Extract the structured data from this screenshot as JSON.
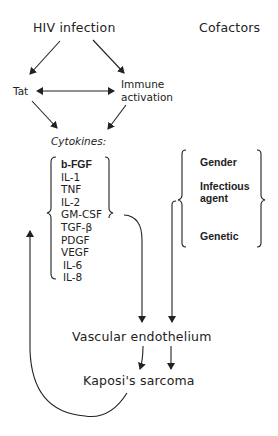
{
  "diagram": {
    "title_left": "HIV infection",
    "title_right": "Cofactors",
    "tat": "Tat",
    "immune": [
      "Immune",
      "activation"
    ],
    "cytokines_heading": "Cytokines:",
    "cytokines": [
      "b-FGF",
      "IL-1",
      "TNF",
      "IL-2",
      "GM-CSF",
      "TGF-β",
      "PDGF",
      "VEGF",
      "IL-6",
      "IL-8"
    ],
    "cofactors": [
      "Gender",
      "Infectious",
      "agent",
      "Genetic"
    ],
    "vascular": "Vascular endothelium",
    "kaposi": "Kaposi's sarcoma",
    "colors": {
      "line": "#222222",
      "text": "#222222",
      "background": "#ffffff"
    }
  }
}
